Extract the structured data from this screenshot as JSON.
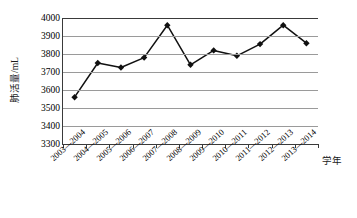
{
  "chart_data": {
    "type": "line",
    "title": "",
    "xlabel": "学年",
    "ylabel": "肺活量/mL",
    "categories": [
      "2003—2004",
      "2004—2005",
      "2005—2006",
      "2006—2007",
      "2007—2008",
      "2008—2009",
      "2009—2010",
      "2010—2011",
      "2011—2012",
      "2012—2013",
      "2013—2014"
    ],
    "values": [
      3560,
      3750,
      3725,
      3780,
      3960,
      3740,
      3820,
      3790,
      3855,
      3960,
      3860
    ],
    "ylim": [
      3300,
      4000
    ],
    "ytick_values": [
      3300,
      3400,
      3500,
      3600,
      3700,
      3800,
      3900,
      4000
    ],
    "ytick_labels": [
      "3300",
      "3400",
      "3500",
      "3600",
      "3700",
      "3800",
      "3900",
      "4000"
    ],
    "grid": true,
    "legend": false,
    "legend_position": "none",
    "marker": "diamond",
    "series_color": "#111111",
    "gridline_color": "#9a9a9a",
    "axis_color": "#3a3a3a"
  }
}
